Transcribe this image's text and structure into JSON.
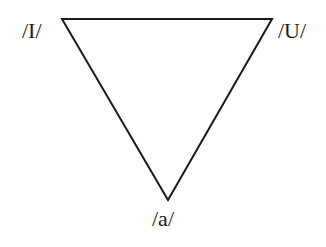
{
  "diagram": {
    "title": "",
    "shape": "inverted-triangle",
    "stroke_color": "#1a1a1a",
    "vertices": [
      {
        "label": "/I/",
        "x": 62,
        "y": 19
      },
      {
        "label": "/U/",
        "x": 272,
        "y": 19
      },
      {
        "label": "/a/",
        "x": 168,
        "y": 200
      }
    ]
  }
}
